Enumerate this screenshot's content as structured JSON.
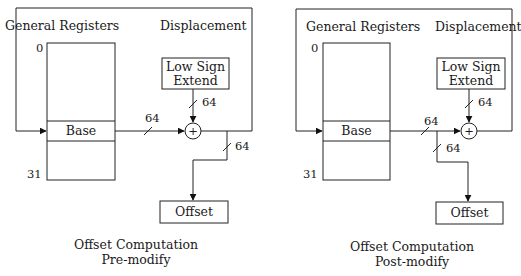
{
  "diagrams": [
    {
      "id": "pre-modify",
      "general_registers_label": "General Registers",
      "displacement_label": "Displacement",
      "reg_index_top": "0",
      "reg_index_bottom": "31",
      "base_label": "Base",
      "sign_extend_line1": "Low Sign",
      "sign_extend_line2": "Extend",
      "adder_symbol": "+",
      "width_sign_extend": "64",
      "width_base": "64",
      "width_output": "64",
      "offset_label": "Offset",
      "caption_line1": "Offset Computation",
      "caption_line2": "Pre-modify"
    },
    {
      "id": "post-modify",
      "general_registers_label": "General Registers",
      "displacement_label": "Displacement",
      "reg_index_top": "0",
      "reg_index_bottom": "31",
      "base_label": "Base",
      "sign_extend_line1": "Low Sign",
      "sign_extend_line2": "Extend",
      "adder_symbol": "+",
      "width_sign_extend": "64",
      "width_base": "64",
      "width_output": "64",
      "offset_label": "Offset",
      "caption_line1": "Offset Computation",
      "caption_line2": "Post-modify"
    }
  ]
}
